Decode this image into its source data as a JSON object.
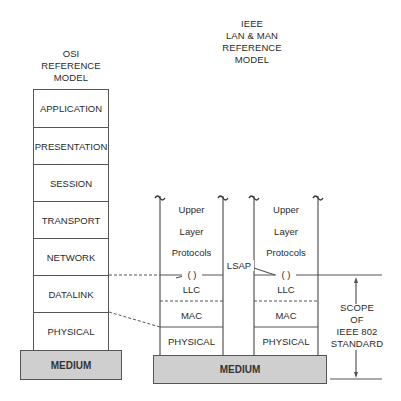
{
  "osi": {
    "title_lines": [
      "OSI",
      "REFERENCE",
      "MODEL"
    ],
    "layers": [
      "APPLICATION",
      "PRESENTATION",
      "SESSION",
      "TRANSPORT",
      "NETWORK",
      "DATALINK",
      "PHYSICAL"
    ],
    "medium": "MEDIUM"
  },
  "ieee": {
    "title_lines": [
      "IEEE",
      "LAN & MAN",
      "REFERENCE",
      "MODEL"
    ],
    "stacks": [
      {
        "upper": [
          "Upper",
          "Layer",
          "Protocols"
        ],
        "llc": "LLC",
        "mac": "MAC",
        "physical": "PHYSICAL",
        "sap_glyph": "( )"
      },
      {
        "upper": [
          "Upper",
          "Layer",
          "Protocols"
        ],
        "llc": "LLC",
        "mac": "MAC",
        "physical": "PHYSICAL",
        "sap_glyph": "( )"
      }
    ],
    "lsap_label": "LSAP",
    "medium": "MEDIUM",
    "break_glyph": "~"
  },
  "scope": {
    "lines": [
      "SCOPE",
      "OF",
      "IEEE 802",
      "STANDARD"
    ]
  },
  "colors": {
    "line": "#555555",
    "medium_fill": "#cfcfcf",
    "text": "#2a2a2a"
  }
}
